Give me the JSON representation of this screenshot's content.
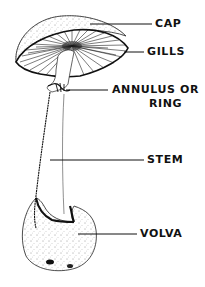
{
  "diagram": {
    "labels": {
      "cap": "CAP",
      "gills": "GILLS",
      "annulus_line1": "ANNULUS OR",
      "annulus_line2": "RING",
      "stem": "STEM",
      "volva": "VOLVA"
    },
    "colors": {
      "ink": "#111111",
      "background": "#ffffff"
    }
  }
}
